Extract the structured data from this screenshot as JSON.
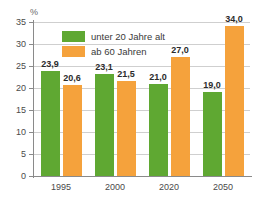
{
  "chart_data": {
    "type": "bar",
    "title": "",
    "xlabel": "",
    "ylabel": "%",
    "unit_label": "%",
    "categories": [
      "1995",
      "2000",
      "2020",
      "2050"
    ],
    "ylim": [
      0,
      35
    ],
    "yticks": [
      0,
      5,
      10,
      15,
      20,
      25,
      30,
      35
    ],
    "ytick_labels": [
      "0",
      "5",
      "10",
      "15",
      "20",
      "25",
      "30",
      "35"
    ],
    "grid": true,
    "legend_position": "top-left-inside",
    "series": [
      {
        "name": "unter 20 Jahre alt",
        "color": "#5FA832",
        "values": [
          23.9,
          23.1,
          21.0,
          19.0
        ],
        "value_labels": [
          "23,9",
          "23,1",
          "21,0",
          "19,0"
        ]
      },
      {
        "name": "ab 60 Jahren",
        "color": "#F5A23C",
        "values": [
          20.6,
          21.5,
          27.0,
          34.0
        ],
        "value_labels": [
          "20,6",
          "21,5",
          "27,0",
          "34,0"
        ]
      }
    ]
  },
  "colors": {
    "green": "#5FA832",
    "orange": "#F5A23C",
    "gridline": "#cfcfcf",
    "axis": "#8a8a8a",
    "background": "#ffffff"
  }
}
